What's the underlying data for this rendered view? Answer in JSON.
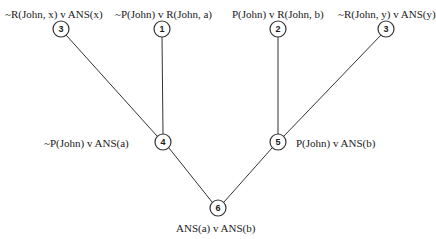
{
  "diagram": {
    "type": "resolution-refutation-tree",
    "nodes": [
      {
        "id": "n3a",
        "number": "3",
        "x": 61,
        "y": 29,
        "label": "~R(John, x) v ANS(x)"
      },
      {
        "id": "n1",
        "number": "1",
        "x": 162,
        "y": 29,
        "label": "~P(John) v R(John, a)"
      },
      {
        "id": "n2",
        "number": "2",
        "x": 278,
        "y": 29,
        "label": "P(John) v R(John, b)"
      },
      {
        "id": "n3b",
        "number": "3",
        "x": 386,
        "y": 29,
        "label": "~R(John, y) v ANS(y)"
      },
      {
        "id": "n4",
        "number": "4",
        "x": 163,
        "y": 142,
        "label": "~P(John) v ANS(a)"
      },
      {
        "id": "n5",
        "number": "5",
        "x": 278,
        "y": 142,
        "label": "P(John) v ANS(b)"
      },
      {
        "id": "n6",
        "number": "6",
        "x": 218,
        "y": 208,
        "label": "ANS(a) v ANS(b)"
      }
    ],
    "edges": [
      {
        "from": "n3a",
        "to": "n4"
      },
      {
        "from": "n1",
        "to": "n4"
      },
      {
        "from": "n2",
        "to": "n5"
      },
      {
        "from": "n3b",
        "to": "n5"
      },
      {
        "from": "n4",
        "to": "n6"
      },
      {
        "from": "n5",
        "to": "n6"
      }
    ],
    "colors": {
      "line": "#333333",
      "text": "#1a1a1a",
      "background": "#ffffff"
    }
  }
}
